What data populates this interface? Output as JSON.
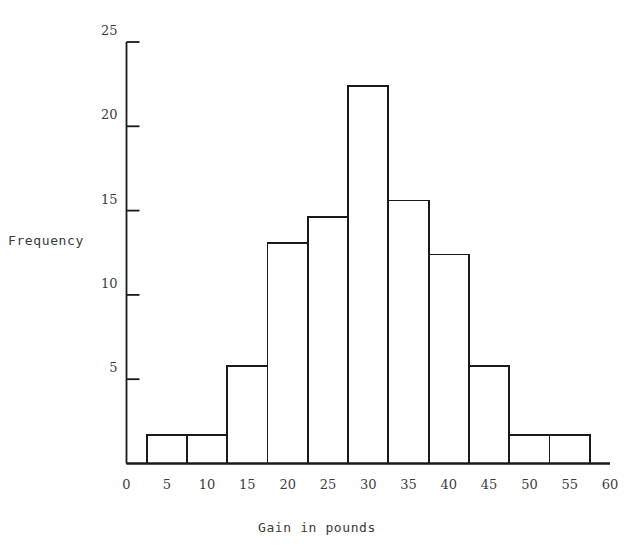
{
  "chart_data": {
    "type": "bar",
    "title": "",
    "subtitle": "",
    "xlabel": "Gain in pounds",
    "ylabel": "Frequency",
    "xlim": [
      0,
      60
    ],
    "ylim": [
      0,
      25
    ],
    "xticks": [
      0,
      5,
      10,
      15,
      20,
      25,
      30,
      35,
      40,
      45,
      50,
      55,
      60
    ],
    "xtick_labels": [
      "0",
      "5",
      "10",
      "15",
      "20",
      "25",
      "30",
      "35",
      "40",
      "45",
      "50",
      "55",
      "60"
    ],
    "yticks": [
      5,
      10,
      15,
      20,
      25
    ],
    "ytick_labels": [
      "5",
      "10",
      "15",
      "20",
      "25"
    ],
    "grid": false,
    "legend": null,
    "bin_width": 5,
    "bin_edges": [
      2.5,
      7.5,
      12.5,
      17.5,
      22.5,
      27.5,
      32.5,
      37.5,
      42.5,
      47.5,
      52.5,
      57.5
    ],
    "categories": [
      "2.5-7.5",
      "7.5-12.5",
      "12.5-17.5",
      "17.5-22.5",
      "22.5-27.5",
      "27.5-32.5",
      "32.5-37.5",
      "37.5-42.5",
      "42.5-47.5",
      "47.5-52.5",
      "52.5-57.5"
    ],
    "values": [
      1.7,
      1.7,
      5.8,
      13.1,
      14.6,
      22.4,
      15.6,
      12.4,
      5.8,
      1.7,
      1.7
    ],
    "bar_color": "#ffffff",
    "bar_edge_color": "#1a1a1a",
    "axis_color": "#1a1a1a"
  },
  "axes": {
    "y_title": "Frequency",
    "x_title": "Gain in pounds"
  }
}
